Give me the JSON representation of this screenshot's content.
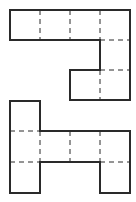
{
  "diagram": {
    "title": "",
    "cell_size": 30,
    "colors": {
      "stroke": "#2a2a2a",
      "background": "#ffffff"
    },
    "nets": [
      {
        "name": "top-net",
        "cells": [
          [
            0,
            0
          ],
          [
            1,
            0
          ],
          [
            2,
            0
          ],
          [
            3,
            0
          ],
          [
            3,
            1
          ],
          [
            2,
            2
          ],
          [
            3,
            2
          ]
        ]
      },
      {
        "name": "bottom-net",
        "cells": [
          [
            0,
            0
          ],
          [
            0,
            1
          ],
          [
            1,
            1
          ],
          [
            2,
            1
          ],
          [
            3,
            1
          ],
          [
            0,
            2
          ],
          [
            3,
            2
          ]
        ]
      }
    ]
  }
}
